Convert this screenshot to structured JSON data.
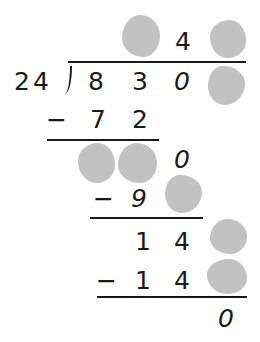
{
  "problem": {
    "type": "long-division",
    "divisor": "24",
    "dividend": [
      "8",
      "3",
      "0",
      "?"
    ],
    "quotient": [
      "?",
      "4",
      "?"
    ],
    "steps": [
      {
        "subtract": [
          "7",
          "2"
        ],
        "remainder": [
          "?",
          "?",
          "0"
        ]
      },
      {
        "subtract": [
          "9",
          "?"
        ],
        "remainder": [
          "1",
          "4",
          "?"
        ]
      },
      {
        "subtract": [
          "1",
          "4",
          "?"
        ],
        "remainder": [
          "0"
        ]
      }
    ],
    "minus_sign": "−",
    "hidden_digit_color": "#c2c2c2"
  }
}
